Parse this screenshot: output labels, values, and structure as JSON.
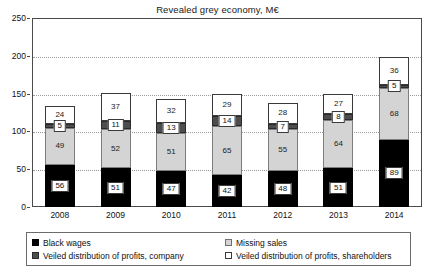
{
  "chart_data": {
    "type": "bar",
    "stacked": true,
    "title": "Revealed grey economy, M€",
    "xlabel": "",
    "ylabel": "",
    "ylim": [
      0,
      250
    ],
    "yticks": [
      0,
      50,
      100,
      150,
      200,
      250
    ],
    "grid": true,
    "legend_position": "bottom",
    "categories": [
      "2008",
      "2009",
      "2010",
      "2011",
      "2012",
      "2013",
      "2014"
    ],
    "series": [
      {
        "name": "Black wages",
        "color": "#000000",
        "values": [
          56,
          51,
          47,
          42,
          48,
          51,
          89
        ]
      },
      {
        "name": "Missing sales",
        "color": "#d4d4d4",
        "values": [
          49,
          52,
          51,
          65,
          55,
          64,
          68
        ]
      },
      {
        "name": "Veiled distribution of profits, company",
        "color": "#4d4d4d",
        "values": [
          5,
          11,
          13,
          14,
          7,
          8,
          5
        ]
      },
      {
        "name": "Veiled distribution of profits, shareholders",
        "color": "#ffffff",
        "values": [
          24,
          37,
          32,
          29,
          28,
          27,
          36
        ]
      }
    ],
    "totals": [
      134,
      151,
      143,
      150,
      138,
      150,
      198
    ]
  },
  "legend": {
    "items": [
      {
        "label": "Black wages",
        "swatch": "sw-black"
      },
      {
        "label": "Missing sales",
        "swatch": "sw-light"
      },
      {
        "label": "Veiled distribution of profits, company",
        "swatch": "sw-dark"
      },
      {
        "label": "Veiled distribution of profits, shareholders",
        "swatch": "sw-white"
      }
    ]
  }
}
